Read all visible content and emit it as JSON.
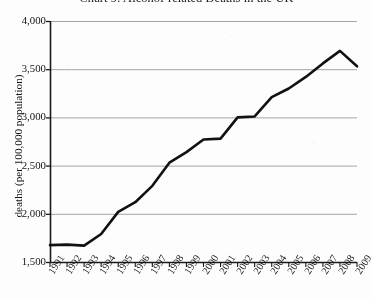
{
  "chart_data": {
    "type": "line",
    "title": "Chart 9: Alcohol-related Deaths in the UK",
    "xlabel": "",
    "ylabel": "deaths (per 100,000 population)",
    "categories": [
      "1991",
      "1992",
      "1993",
      "1994",
      "1995",
      "1996",
      "1997",
      "1998",
      "1999",
      "2000",
      "2001",
      "2002",
      "2003",
      "2004",
      "2005",
      "2006",
      "2007",
      "2008",
      "2009"
    ],
    "values": [
      1675,
      1680,
      1670,
      1790,
      2020,
      2120,
      2290,
      2530,
      2640,
      2770,
      2780,
      3000,
      3010,
      3210,
      3300,
      3420,
      3560,
      3690,
      3530
    ],
    "ylim": [
      1500,
      4000
    ],
    "yticks": [
      1500,
      2000,
      2500,
      3000,
      3500,
      4000
    ],
    "ytick_labels": [
      "1,500",
      "2,000",
      "2,500",
      "3,000",
      "3,500",
      "4,000"
    ],
    "grid": true,
    "legend": null,
    "series_color": "#111111",
    "grid_color": "#9a9a9a",
    "axis_color": "#1a1a1a"
  },
  "figure": {
    "background": "#fdfdfd"
  }
}
